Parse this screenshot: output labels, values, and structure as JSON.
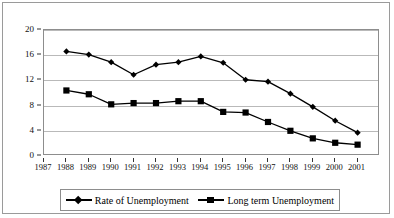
{
  "chart_data": {
    "type": "line",
    "title": "",
    "subtitle": "",
    "xlabel": "",
    "ylabel": "",
    "categories": [
      "1987",
      "1988",
      "1989",
      "1990",
      "1991",
      "1992",
      "1993",
      "1994",
      "1995",
      "1996",
      "1997",
      "1998",
      "1999",
      "2000",
      "2001"
    ],
    "x_tick_labels": [
      "1987",
      "1988",
      "1989",
      "1990",
      "1991",
      "1992",
      "1993",
      "1994",
      "1995",
      "1996",
      "1997",
      "1998",
      "1999",
      "2000",
      "2001"
    ],
    "y_tick_labels": [
      "0",
      "4",
      "8",
      "12",
      "16",
      "20"
    ],
    "y_ticks": [
      0,
      4,
      8,
      12,
      16,
      20
    ],
    "ylim": [
      0,
      20
    ],
    "grid": true,
    "legend_position": "bottom",
    "series": [
      {
        "name": "Rate of Unemployment",
        "marker": "diamond",
        "color": "#000000",
        "x": [
          "1988",
          "1989",
          "1990",
          "1991",
          "1992",
          "1993",
          "1994",
          "1995",
          "1996",
          "1997",
          "1998",
          "1999",
          "2000",
          "2001"
        ],
        "values": [
          16.6,
          16.1,
          14.9,
          12.9,
          14.5,
          14.9,
          15.8,
          14.8,
          12.1,
          11.8,
          9.9,
          7.8,
          5.6,
          3.7
        ]
      },
      {
        "name": "Long term Unemployment",
        "marker": "square",
        "color": "#000000",
        "x": [
          "1988",
          "1989",
          "1990",
          "1991",
          "1992",
          "1993",
          "1994",
          "1995",
          "1996",
          "1997",
          "1998",
          "1999",
          "2000",
          "2001"
        ],
        "values": [
          10.4,
          9.8,
          8.2,
          8.4,
          8.4,
          8.7,
          8.7,
          7.0,
          6.9,
          5.4,
          4.0,
          2.8,
          2.1,
          1.8
        ]
      }
    ]
  },
  "legend": {
    "entries": [
      {
        "label": "Rate of Unemployment",
        "marker": "diamond"
      },
      {
        "label": "Long term Unemployment",
        "marker": "square"
      }
    ]
  }
}
